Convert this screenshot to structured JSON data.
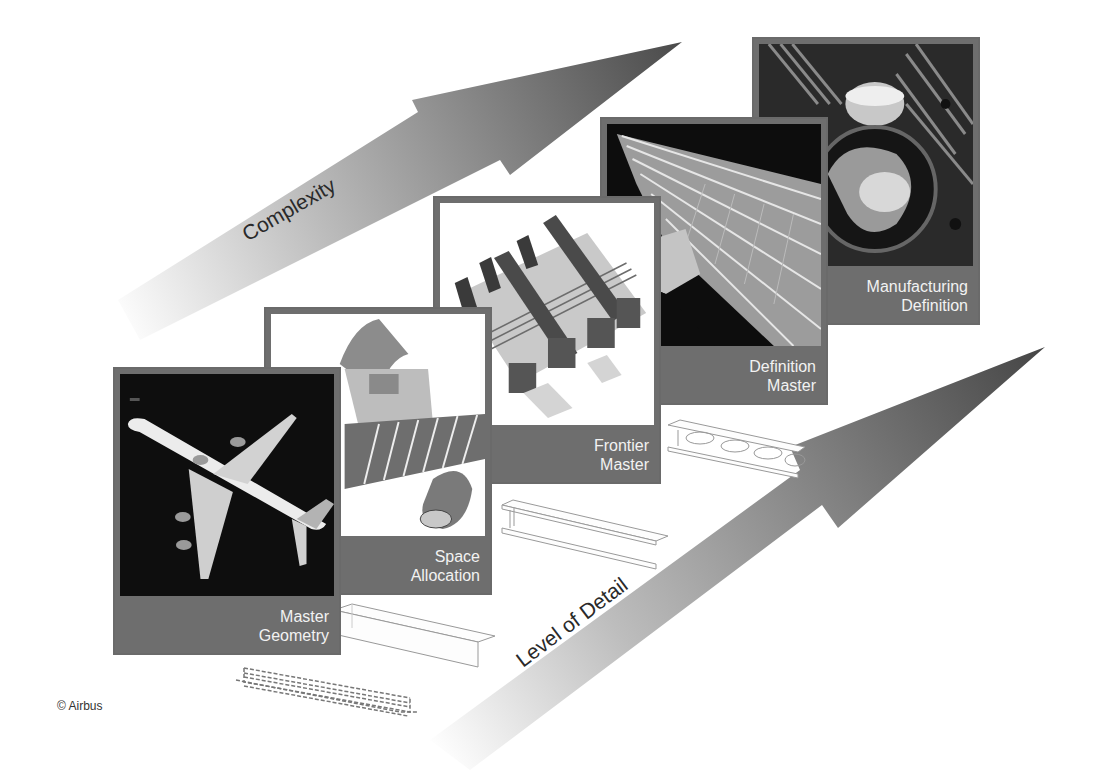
{
  "arrows": {
    "complexity": {
      "label": "Complexity",
      "color_dark": "#4a4a4a",
      "color_light": "#f2f2f2"
    },
    "level_of_detail": {
      "label": "Level of Detail",
      "color_dark": "#444444",
      "color_light": "#f2f2f2"
    }
  },
  "stages": [
    {
      "id": "master-geometry",
      "caption_line1": "Master",
      "caption_line2": "Geometry",
      "image": "aircraft-3d-model"
    },
    {
      "id": "space-allocation",
      "caption_line1": "Space",
      "caption_line2": "Allocation",
      "image": "fuselage-wing-engine-volumes"
    },
    {
      "id": "frontier-master",
      "caption_line1": "Frontier",
      "caption_line2": "Master",
      "image": "structural-assembly-frames"
    },
    {
      "id": "definition-master",
      "caption_line1": "Definition",
      "caption_line2": "Master",
      "image": "wing-structure-detail"
    },
    {
      "id": "manufacturing-definition",
      "caption_line1": "Manufacturing",
      "caption_line2": "Definition",
      "image": "machined-part-photo"
    }
  ],
  "beams": [
    {
      "id": "dashed-wireframe-beam",
      "style": "dashed"
    },
    {
      "id": "box-beam",
      "style": "outline"
    },
    {
      "id": "i-beam",
      "style": "outline"
    },
    {
      "id": "i-beam-with-holes",
      "style": "outline"
    }
  ],
  "colors": {
    "panel_frame": "#6e6e6e",
    "caption_text": "#f2f2f2",
    "background": "#ffffff"
  },
  "footer": {
    "copyright": "© Airbus"
  }
}
